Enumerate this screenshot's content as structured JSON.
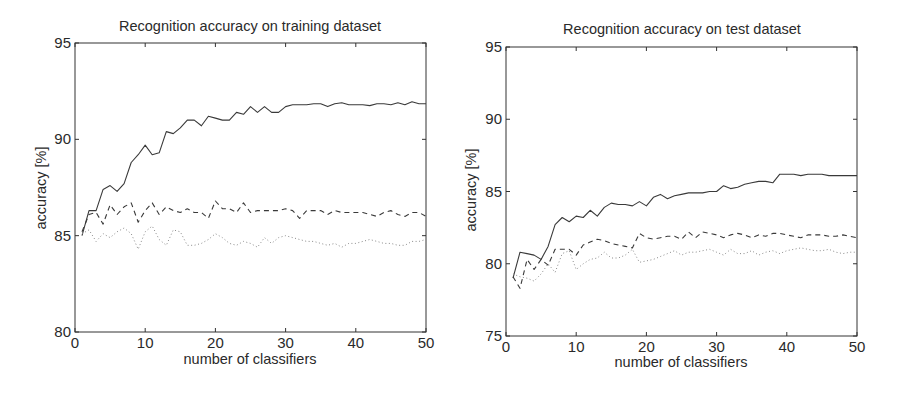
{
  "chart_data": [
    {
      "type": "line",
      "title": "Recognition accuracy on training dataset",
      "xlabel": "number of classifiers",
      "ylabel": "accuracy [%]",
      "xlim": [
        0,
        50
      ],
      "ylim": [
        80,
        95
      ],
      "xticks": [
        0,
        10,
        20,
        30,
        40,
        50
      ],
      "yticks": [
        80,
        85,
        90,
        95
      ],
      "grid": false,
      "legend": null,
      "x": [
        1,
        2,
        3,
        4,
        5,
        6,
        7,
        8,
        9,
        10,
        11,
        12,
        13,
        14,
        15,
        16,
        17,
        18,
        19,
        20,
        21,
        22,
        23,
        24,
        25,
        26,
        27,
        28,
        29,
        30,
        31,
        32,
        33,
        34,
        35,
        36,
        37,
        38,
        39,
        40,
        41,
        42,
        43,
        44,
        45,
        46,
        47,
        48,
        49,
        50
      ],
      "series": [
        {
          "name": "solid",
          "style": "solid",
          "values": [
            85.0,
            86.3,
            86.3,
            87.4,
            87.6,
            87.3,
            87.7,
            88.8,
            89.2,
            89.7,
            89.2,
            89.3,
            90.4,
            90.3,
            90.6,
            91.0,
            91.0,
            90.7,
            91.2,
            91.1,
            91.0,
            91.0,
            91.4,
            91.3,
            91.7,
            91.4,
            91.7,
            91.4,
            91.4,
            91.7,
            91.8,
            91.8,
            91.8,
            91.85,
            91.85,
            91.7,
            91.85,
            91.9,
            91.8,
            91.8,
            91.8,
            91.75,
            91.85,
            91.85,
            91.8,
            91.9,
            91.8,
            91.95,
            91.85,
            91.85
          ]
        },
        {
          "name": "dashed",
          "style": "dashed",
          "values": [
            85.2,
            86.1,
            86.2,
            85.6,
            86.6,
            86.1,
            86.5,
            86.7,
            85.7,
            86.3,
            86.7,
            86.1,
            86.5,
            86.3,
            86.2,
            86.4,
            86.2,
            86.2,
            85.9,
            86.8,
            86.4,
            86.4,
            86.2,
            86.7,
            86.2,
            86.3,
            86.3,
            86.3,
            86.3,
            86.4,
            86.3,
            85.9,
            86.3,
            86.3,
            86.3,
            86.1,
            86.3,
            86.2,
            86.2,
            86.2,
            86.2,
            86.1,
            86.0,
            86.2,
            86.3,
            86.1,
            86.0,
            86.2,
            86.2,
            86.0
          ]
        },
        {
          "name": "dotted",
          "style": "dotted",
          "values": [
            85.1,
            85.3,
            84.7,
            85.1,
            84.9,
            85.2,
            85.4,
            85.1,
            84.3,
            85.2,
            85.5,
            84.8,
            84.5,
            85.3,
            85.2,
            84.5,
            84.5,
            84.6,
            84.8,
            85.1,
            84.9,
            84.6,
            84.5,
            84.7,
            84.6,
            84.4,
            84.9,
            84.6,
            84.9,
            85.0,
            84.9,
            84.8,
            84.7,
            84.7,
            84.6,
            84.5,
            84.6,
            84.4,
            84.6,
            84.6,
            84.7,
            84.8,
            84.7,
            84.6,
            84.6,
            84.5,
            84.5,
            84.7,
            84.7,
            84.8
          ]
        }
      ]
    },
    {
      "type": "line",
      "title": "Recognition accuracy on test dataset",
      "xlabel": "number of classifiers",
      "ylabel": "accuracy [%]",
      "xlim": [
        0,
        50
      ],
      "ylim": [
        75,
        95
      ],
      "xticks": [
        0,
        10,
        20,
        30,
        40,
        50
      ],
      "yticks": [
        75,
        80,
        85,
        90,
        95
      ],
      "grid": false,
      "legend": null,
      "x": [
        1,
        2,
        3,
        4,
        5,
        6,
        7,
        8,
        9,
        10,
        11,
        12,
        13,
        14,
        15,
        16,
        17,
        18,
        19,
        20,
        21,
        22,
        23,
        24,
        25,
        26,
        27,
        28,
        29,
        30,
        31,
        32,
        33,
        34,
        35,
        36,
        37,
        38,
        39,
        40,
        41,
        42,
        43,
        44,
        45,
        46,
        47,
        48,
        49,
        50
      ],
      "series": [
        {
          "name": "solid",
          "style": "solid",
          "values": [
            79.0,
            80.8,
            80.7,
            80.6,
            80.3,
            81.2,
            82.7,
            83.2,
            82.9,
            83.3,
            83.2,
            83.7,
            83.3,
            83.9,
            84.2,
            84.1,
            84.1,
            84.0,
            84.3,
            84.0,
            84.6,
            84.8,
            84.5,
            84.7,
            84.8,
            84.9,
            84.9,
            84.9,
            85.0,
            85.0,
            85.4,
            85.2,
            85.3,
            85.5,
            85.6,
            85.7,
            85.7,
            85.6,
            86.2,
            86.2,
            86.2,
            86.1,
            86.2,
            86.2,
            86.2,
            86.1,
            86.1,
            86.1,
            86.1,
            86.1
          ]
        },
        {
          "name": "dashed",
          "style": "dashed",
          "values": [
            79.1,
            78.3,
            80.3,
            79.6,
            80.3,
            79.9,
            81.0,
            81.0,
            81.0,
            80.6,
            81.3,
            81.5,
            81.7,
            81.6,
            81.4,
            81.3,
            81.2,
            81.1,
            82.1,
            81.8,
            81.7,
            81.8,
            81.9,
            81.9,
            81.7,
            82.2,
            81.8,
            82.2,
            82.1,
            82.0,
            81.8,
            82.0,
            82.1,
            82.0,
            81.8,
            82.0,
            81.9,
            82.1,
            82.1,
            82.0,
            81.9,
            81.8,
            82.0,
            82.0,
            82.0,
            81.9,
            81.9,
            82.0,
            81.9,
            81.8
          ]
        },
        {
          "name": "dotted",
          "style": "dotted",
          "values": [
            79.3,
            79.1,
            79.0,
            78.8,
            79.3,
            80.0,
            79.4,
            80.7,
            80.9,
            79.6,
            80.0,
            80.3,
            80.4,
            80.8,
            80.4,
            80.4,
            80.6,
            81.0,
            80.1,
            80.2,
            80.3,
            80.5,
            80.7,
            80.9,
            80.6,
            80.8,
            80.8,
            80.9,
            81.0,
            80.8,
            80.6,
            81.0,
            80.7,
            80.7,
            80.9,
            80.6,
            80.8,
            80.9,
            80.7,
            80.9,
            81.0,
            81.1,
            81.0,
            80.9,
            80.9,
            81.0,
            80.8,
            80.7,
            80.8,
            80.8
          ]
        }
      ]
    }
  ],
  "ui": {
    "left_title": "Recognition accuracy on training dataset",
    "right_title": "Recognition accuracy on test dataset",
    "xlabel": "number of classifiers",
    "ylabel": "accuracy [%]",
    "line_color": "#3a3a3a",
    "dotted_color": "#8a8a8a",
    "axis_color": "#333333"
  }
}
